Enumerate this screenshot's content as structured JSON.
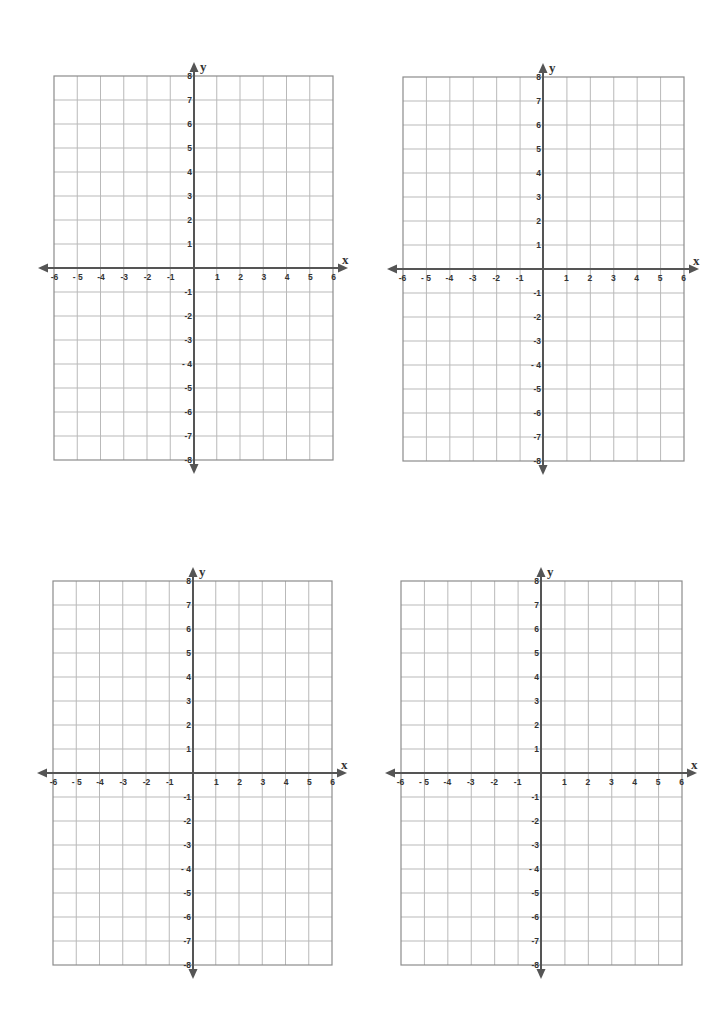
{
  "page": {
    "background": "#ffffff"
  },
  "style": {
    "grid_color": "#b9b9b9",
    "border_color": "#8c8c8c",
    "axis_color": "#555555",
    "label_color": "#333333"
  },
  "graphs": [
    {
      "id": "graph-top-left",
      "grid": {
        "left": 54,
        "top": 76,
        "right": 333,
        "bottom": 460
      },
      "origin": {
        "x": 194,
        "y": 268
      }
    },
    {
      "id": "graph-top-right",
      "grid": {
        "left": 403,
        "top": 77,
        "right": 684,
        "bottom": 461
      },
      "origin": {
        "x": 543,
        "y": 269
      }
    },
    {
      "id": "graph-bottom-left",
      "grid": {
        "left": 53,
        "top": 581,
        "right": 332,
        "bottom": 965
      },
      "origin": {
        "x": 193,
        "y": 773
      }
    },
    {
      "id": "graph-bottom-right",
      "grid": {
        "left": 401,
        "top": 581,
        "right": 682,
        "bottom": 965
      },
      "origin": {
        "x": 541,
        "y": 773
      }
    }
  ],
  "axes": {
    "x_label": "x",
    "y_label": "y",
    "x_ticks": [
      -6,
      -5,
      -4,
      -3,
      -2,
      -1,
      1,
      2,
      3,
      4,
      5,
      6
    ],
    "x_tick_labels": [
      "-6",
      "- 5",
      "-4",
      "-3",
      "-2",
      "-1",
      "1",
      "2",
      "3",
      "4",
      "5",
      "6"
    ],
    "y_ticks": [
      8,
      7,
      6,
      5,
      4,
      3,
      2,
      1,
      -1,
      -2,
      -3,
      -4,
      -5,
      -6,
      -7,
      -8
    ],
    "y_tick_labels": [
      "8",
      "7",
      "6",
      "5",
      "4",
      "3",
      "2",
      "1",
      "-1",
      "-2",
      "-3",
      "- 4",
      "-5",
      "-6",
      "-7",
      "-8"
    ],
    "xlim": [
      -6,
      6
    ],
    "ylim": [
      -8,
      8
    ]
  },
  "chart_data": [
    {
      "type": "scatter",
      "title": "",
      "xlabel": "x",
      "ylabel": "y",
      "xlim": [
        -6,
        6
      ],
      "ylim": [
        -8,
        8
      ],
      "grid": true,
      "series": []
    },
    {
      "type": "scatter",
      "title": "",
      "xlabel": "x",
      "ylabel": "y",
      "xlim": [
        -6,
        6
      ],
      "ylim": [
        -8,
        8
      ],
      "grid": true,
      "series": []
    },
    {
      "type": "scatter",
      "title": "",
      "xlabel": "x",
      "ylabel": "y",
      "xlim": [
        -6,
        6
      ],
      "ylim": [
        -8,
        8
      ],
      "grid": true,
      "series": []
    },
    {
      "type": "scatter",
      "title": "",
      "xlabel": "x",
      "ylabel": "y",
      "xlim": [
        -6,
        6
      ],
      "ylim": [
        -8,
        8
      ],
      "grid": true,
      "series": []
    }
  ]
}
